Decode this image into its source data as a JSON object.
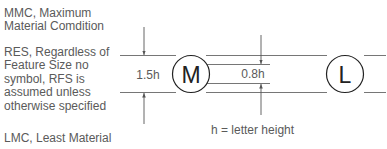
{
  "descriptions": [
    {
      "id": "mmc",
      "text": "MMC, Maximum\nMaterial Comdition"
    },
    {
      "id": "rfs",
      "text": "RES, Regardless of\nFeature Size no\nsymbol, RFS is\nassumed unless\notherwise specified"
    },
    {
      "id": "lmc",
      "text": "LMC, Least Material"
    }
  ],
  "diagram": {
    "dimension_outer": "1.5h",
    "dimension_inner": "0.8h",
    "symbol_mmc": "M",
    "symbol_lmc": "L",
    "legend": "h = letter height"
  },
  "colors": {
    "text": "#5a5a5a",
    "lines": "#555555",
    "symbol": "#222222"
  }
}
